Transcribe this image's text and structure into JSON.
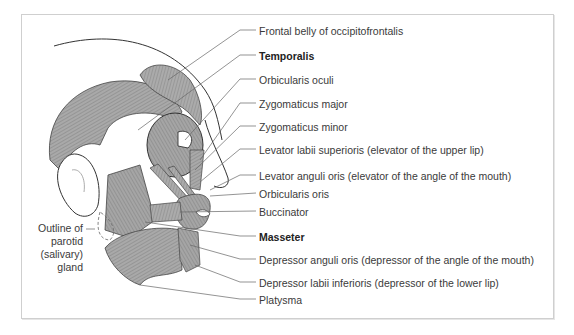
{
  "figure": {
    "colors": {
      "muscle_fill": "#a9a9a9",
      "muscle_stroke": "#3c3c3c",
      "leader": "#555555",
      "frame": "#cfcfcf"
    }
  },
  "labels": [
    {
      "text": "Frontal belly of occipitofrontalis",
      "bold": false,
      "y": 25
    },
    {
      "text": "Temporalis",
      "bold": true,
      "y": 50
    },
    {
      "text": "Orbicularis oculi",
      "bold": false,
      "y": 74
    },
    {
      "text": "Zygomaticus major",
      "bold": false,
      "y": 98
    },
    {
      "text": "Zygomaticus minor",
      "bold": false,
      "y": 121
    },
    {
      "text": "Levator labii superioris (elevator of the upper lip)",
      "bold": false,
      "y": 144
    },
    {
      "text": "Levator anguli oris (elevator of the angle of the mouth)",
      "bold": false,
      "y": 170
    },
    {
      "text": "Orbicularis oris",
      "bold": false,
      "y": 188
    },
    {
      "text": "Buccinator",
      "bold": false,
      "y": 206
    },
    {
      "text": "Masseter",
      "bold": true,
      "y": 231
    },
    {
      "text": "Depressor anguli oris (depressor of the angle of the mouth)",
      "bold": false,
      "y": 254
    },
    {
      "text": "Depressor labii inferioris (depressor of the lower lip)",
      "bold": false,
      "y": 277
    },
    {
      "text": "Platysma",
      "bold": false,
      "y": 294
    }
  ],
  "parotid_label": {
    "lines": [
      "Outline of",
      "parotid",
      "(salivary)",
      "gland"
    ]
  }
}
